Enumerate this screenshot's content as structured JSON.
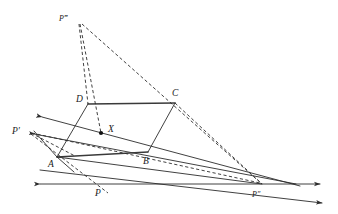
{
  "figure": {
    "background_color": "#ffffff",
    "line_color": "#2b2b2b",
    "labels": {
      "vertex_a": "A",
      "vertex_b": "B",
      "vertex_c": "C",
      "vertex_d": "D",
      "point_x": "X",
      "point_p": "P",
      "point_p_prime": "P′",
      "point_p_double_prime": "P″",
      "point_p_triple_prime": "P‴"
    },
    "points": {
      "A": {
        "x": 57,
        "y": 157
      },
      "B": {
        "x": 148,
        "y": 152
      },
      "C": {
        "x": 175,
        "y": 103
      },
      "D": {
        "x": 88,
        "y": 104
      },
      "X": {
        "x": 101,
        "y": 133
      },
      "P": {
        "x": 98,
        "y": 184
      },
      "P_prime": {
        "x": 30,
        "y": 131
      },
      "P_double_prime": {
        "x": 262,
        "y": 184
      },
      "P_triple_prime": {
        "x": 78,
        "y": 21
      }
    },
    "label_positions": {
      "A": {
        "x": 48,
        "y": 167
      },
      "B": {
        "x": 143,
        "y": 164
      },
      "C": {
        "x": 172,
        "y": 96
      },
      "D": {
        "x": 79,
        "y": 101
      },
      "X": {
        "x": 108,
        "y": 131
      },
      "P": {
        "x": 95,
        "y": 195
      },
      "P_prime": {
        "x": 13,
        "y": 131
      },
      "P_double_prime": {
        "x": 253,
        "y": 196
      },
      "P_triple_prime": {
        "x": 61,
        "y": 18
      }
    },
    "elements": {
      "parallelogram": "ABCD",
      "baseline_name": "horizon-line",
      "baseline_y": 184,
      "baseline_x_start": 37,
      "baseline_x_end": 322
    }
  }
}
